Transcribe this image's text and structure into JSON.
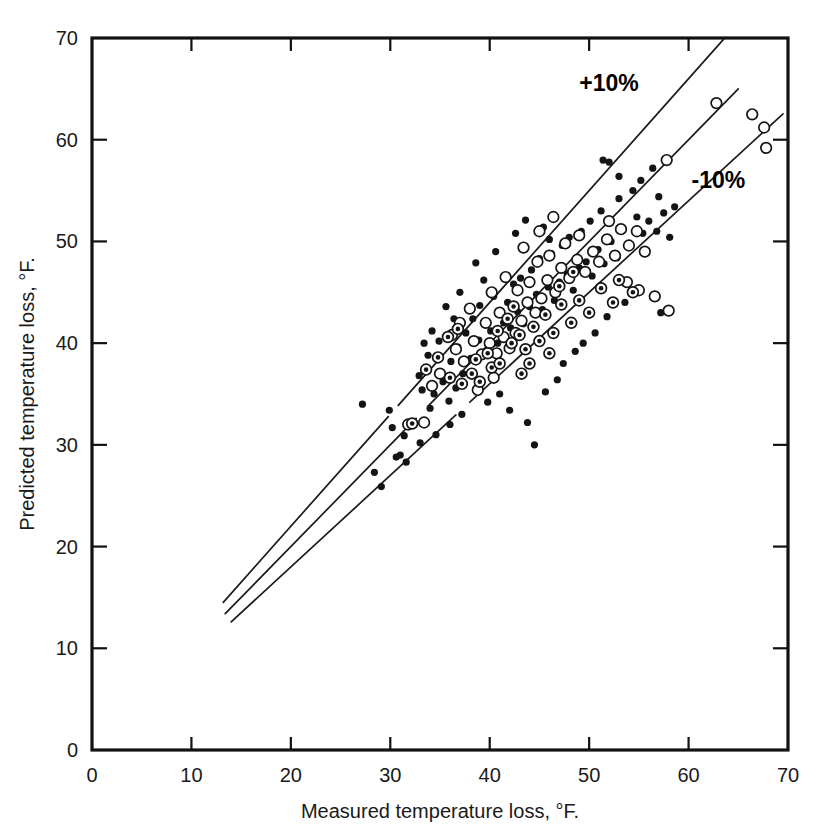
{
  "chart_data": {
    "type": "scatter",
    "title": "",
    "xlabel": "Measured temperature loss, °F.",
    "ylabel": "Predicted temperature loss, °F.",
    "xlim": [
      0,
      70
    ],
    "ylim": [
      0,
      70
    ],
    "xticks": [
      0,
      10,
      20,
      30,
      40,
      50,
      60,
      70
    ],
    "yticks": [
      0,
      10,
      20,
      30,
      40,
      50,
      60,
      70
    ],
    "xtick_labels": [
      "0",
      "10",
      "20",
      "30",
      "40",
      "50",
      "60",
      "70"
    ],
    "ytick_labels": [
      "0",
      "10",
      "20",
      "30",
      "40",
      "50",
      "60",
      "70"
    ],
    "grid": false,
    "legend": "none",
    "annotations": [
      {
        "text": "+10%",
        "x": 52.0,
        "y": 64.8
      },
      {
        "text": "-10%",
        "x": 63.0,
        "y": 55.3
      }
    ],
    "reference_lines": [
      {
        "name": "plus-10-percent",
        "label": "+10%",
        "slope": 1.1,
        "intercept": 0,
        "x_start": 13.2,
        "x_end": 63.6,
        "break_x_start": 29.8,
        "break_x_end": 30.8
      },
      {
        "name": "parity",
        "label": "y = x",
        "slope": 1.0,
        "intercept": 0,
        "x_start": 13.4,
        "x_end": 65.0,
        "break_x_start": 32.6,
        "break_x_end": 33.8
      },
      {
        "name": "minus-10-percent",
        "label": "-10%",
        "slope": 0.9,
        "intercept": 0,
        "x_start": 14.0,
        "x_end": 69.5,
        "break_x_start": 36.6,
        "break_x_end": 38.0
      }
    ],
    "series": [
      {
        "name": "filled-circle",
        "marker": "filled-circle",
        "points": [
          [
            27.2,
            34.0
          ],
          [
            28.4,
            27.3
          ],
          [
            29.1,
            25.9
          ],
          [
            30.6,
            28.8
          ],
          [
            31.0,
            29.0
          ],
          [
            31.6,
            28.3
          ],
          [
            30.2,
            31.7
          ],
          [
            31.4,
            30.9
          ],
          [
            32.2,
            32.1
          ],
          [
            29.9,
            33.4
          ],
          [
            33.2,
            35.4
          ],
          [
            34.0,
            33.6
          ],
          [
            32.9,
            36.8
          ],
          [
            34.4,
            35.0
          ],
          [
            35.3,
            36.2
          ],
          [
            33.8,
            38.8
          ],
          [
            35.9,
            34.3
          ],
          [
            36.6,
            35.6
          ],
          [
            34.9,
            40.2
          ],
          [
            36.1,
            38.2
          ],
          [
            37.3,
            37.0
          ],
          [
            36.8,
            39.6
          ],
          [
            38.1,
            38.5
          ],
          [
            37.6,
            41.0
          ],
          [
            38.9,
            40.3
          ],
          [
            39.5,
            39.1
          ],
          [
            38.3,
            42.4
          ],
          [
            40.1,
            41.2
          ],
          [
            39.0,
            43.7
          ],
          [
            40.8,
            40.0
          ],
          [
            41.4,
            42.0
          ],
          [
            40.4,
            44.6
          ],
          [
            42.1,
            41.5
          ],
          [
            41.8,
            44.0
          ],
          [
            42.8,
            43.1
          ],
          [
            43.4,
            41.9
          ],
          [
            42.4,
            45.8
          ],
          [
            44.0,
            43.6
          ],
          [
            43.1,
            46.4
          ],
          [
            44.7,
            44.8
          ],
          [
            45.3,
            43.3
          ],
          [
            44.2,
            47.2
          ],
          [
            45.9,
            45.5
          ],
          [
            46.5,
            44.2
          ],
          [
            45.0,
            48.3
          ],
          [
            47.0,
            46.0
          ],
          [
            46.2,
            48.8
          ],
          [
            47.8,
            46.8
          ],
          [
            48.4,
            45.2
          ],
          [
            47.3,
            49.6
          ],
          [
            49.0,
            47.4
          ],
          [
            48.0,
            50.4
          ],
          [
            49.7,
            48.0
          ],
          [
            50.3,
            46.6
          ],
          [
            49.2,
            51.0
          ],
          [
            50.9,
            49.2
          ],
          [
            51.5,
            47.8
          ],
          [
            50.1,
            52.0
          ],
          [
            52.2,
            50.0
          ],
          [
            52.8,
            48.4
          ],
          [
            51.2,
            53.0
          ],
          [
            53.4,
            51.2
          ],
          [
            54.1,
            49.6
          ],
          [
            53.0,
            54.2
          ],
          [
            54.8,
            52.4
          ],
          [
            55.4,
            50.8
          ],
          [
            56.0,
            52.0
          ],
          [
            56.8,
            51.0
          ],
          [
            57.5,
            52.8
          ],
          [
            58.1,
            50.4
          ],
          [
            57.0,
            54.4
          ],
          [
            58.6,
            53.4
          ],
          [
            52.0,
            57.8
          ],
          [
            53.0,
            56.4
          ],
          [
            51.4,
            58.0
          ],
          [
            54.4,
            55.0
          ],
          [
            55.2,
            56.0
          ],
          [
            56.4,
            57.2
          ],
          [
            57.2,
            43.0
          ],
          [
            44.5,
            30.0
          ],
          [
            42.0,
            33.4
          ],
          [
            43.8,
            32.2
          ],
          [
            41.0,
            35.0
          ],
          [
            39.8,
            34.2
          ],
          [
            36.0,
            32.0
          ],
          [
            37.2,
            33.0
          ],
          [
            34.6,
            31.0
          ],
          [
            33.0,
            30.2
          ],
          [
            46.8,
            36.4
          ],
          [
            45.6,
            35.2
          ],
          [
            47.4,
            38.0
          ],
          [
            48.6,
            39.2
          ],
          [
            50.6,
            41.0
          ],
          [
            49.4,
            40.0
          ],
          [
            51.8,
            42.6
          ],
          [
            53.6,
            44.0
          ],
          [
            38.6,
            47.9
          ],
          [
            39.4,
            46.2
          ],
          [
            40.6,
            49.0
          ],
          [
            37.0,
            45.0
          ],
          [
            35.6,
            43.6
          ],
          [
            36.4,
            42.4
          ],
          [
            42.6,
            50.8
          ],
          [
            43.6,
            52.1
          ],
          [
            34.2,
            41.2
          ],
          [
            33.4,
            40.0
          ],
          [
            45.4,
            51.4
          ],
          [
            46.0,
            50.2
          ]
        ]
      },
      {
        "name": "open-circle",
        "marker": "open-circle",
        "points": [
          [
            31.8,
            32.0
          ],
          [
            33.4,
            32.2
          ],
          [
            36.6,
            39.4
          ],
          [
            37.4,
            38.2
          ],
          [
            38.4,
            40.2
          ],
          [
            39.2,
            38.9
          ],
          [
            40.0,
            40.0
          ],
          [
            40.7,
            39.0
          ],
          [
            41.4,
            40.6
          ],
          [
            42.0,
            39.5
          ],
          [
            39.6,
            42.0
          ],
          [
            41.0,
            43.0
          ],
          [
            42.6,
            41.0
          ],
          [
            43.2,
            42.2
          ],
          [
            38.0,
            43.4
          ],
          [
            37.0,
            42.0
          ],
          [
            36.2,
            40.8
          ],
          [
            43.8,
            44.0
          ],
          [
            44.6,
            43.0
          ],
          [
            45.2,
            44.4
          ],
          [
            44.0,
            46.0
          ],
          [
            42.8,
            45.2
          ],
          [
            41.6,
            46.5
          ],
          [
            40.2,
            45.0
          ],
          [
            45.8,
            46.2
          ],
          [
            46.6,
            45.0
          ],
          [
            47.2,
            47.4
          ],
          [
            46.0,
            48.6
          ],
          [
            44.8,
            48.0
          ],
          [
            48.0,
            46.4
          ],
          [
            48.8,
            48.2
          ],
          [
            47.6,
            49.8
          ],
          [
            49.6,
            47.0
          ],
          [
            50.4,
            49.0
          ],
          [
            49.0,
            50.6
          ],
          [
            51.0,
            48.0
          ],
          [
            51.8,
            50.2
          ],
          [
            52.6,
            48.6
          ],
          [
            53.2,
            51.2
          ],
          [
            52.0,
            52.0
          ],
          [
            54.0,
            49.6
          ],
          [
            54.8,
            51.0
          ],
          [
            55.6,
            49.0
          ],
          [
            57.8,
            58.0
          ],
          [
            62.8,
            63.6
          ],
          [
            66.4,
            62.5
          ],
          [
            67.6,
            61.2
          ],
          [
            67.8,
            59.2
          ],
          [
            58.0,
            43.2
          ],
          [
            56.6,
            44.6
          ],
          [
            55.0,
            45.2
          ],
          [
            53.8,
            46.0
          ],
          [
            35.0,
            37.0
          ],
          [
            34.2,
            35.8
          ],
          [
            38.8,
            35.4
          ],
          [
            40.4,
            36.6
          ],
          [
            46.4,
            52.4
          ],
          [
            45.0,
            51.0
          ],
          [
            43.4,
            49.4
          ]
        ]
      },
      {
        "name": "dotted-circle",
        "marker": "circle-with-dot",
        "points": [
          [
            32.2,
            32.1
          ],
          [
            34.8,
            38.6
          ],
          [
            36.0,
            36.6
          ],
          [
            37.2,
            36.0
          ],
          [
            38.2,
            37.0
          ],
          [
            39.0,
            36.2
          ],
          [
            40.2,
            37.6
          ],
          [
            41.0,
            38.0
          ],
          [
            39.8,
            39.0
          ],
          [
            38.6,
            38.4
          ],
          [
            40.8,
            41.2
          ],
          [
            42.2,
            40.0
          ],
          [
            43.0,
            40.8
          ],
          [
            41.8,
            42.4
          ],
          [
            42.4,
            43.6
          ],
          [
            43.6,
            39.4
          ],
          [
            44.4,
            41.6
          ],
          [
            45.0,
            40.2
          ],
          [
            35.8,
            40.6
          ],
          [
            36.8,
            41.4
          ],
          [
            44.0,
            38.0
          ],
          [
            45.6,
            42.8
          ],
          [
            46.4,
            41.0
          ],
          [
            47.2,
            43.8
          ],
          [
            48.2,
            42.0
          ],
          [
            49.0,
            44.2
          ],
          [
            50.0,
            43.0
          ],
          [
            51.2,
            45.4
          ],
          [
            52.4,
            44.0
          ],
          [
            53.0,
            46.2
          ],
          [
            54.4,
            45.0
          ],
          [
            33.6,
            37.4
          ],
          [
            47.0,
            45.6
          ],
          [
            48.4,
            47.0
          ],
          [
            43.2,
            37.0
          ],
          [
            46.0,
            39.0
          ]
        ]
      }
    ]
  },
  "axes": {
    "x_axis_name": "measured-temperature-loss-axis",
    "y_axis_name": "predicted-temperature-loss-axis"
  },
  "colors": {
    "ink": "#141414",
    "background": "#ffffff",
    "frame": "#111111"
  }
}
